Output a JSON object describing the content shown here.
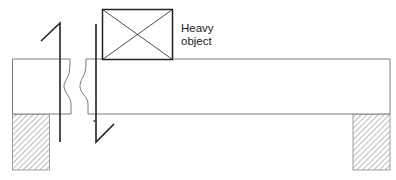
{
  "diagram": {
    "type": "simply-supported beam with section cut",
    "load_label_line1": "Heavy",
    "load_label_line2": "object",
    "colors": {
      "stroke": "#222222",
      "beam_stroke": "#7a7a7a",
      "hatch": "#777777",
      "background": "#ffffff"
    }
  }
}
